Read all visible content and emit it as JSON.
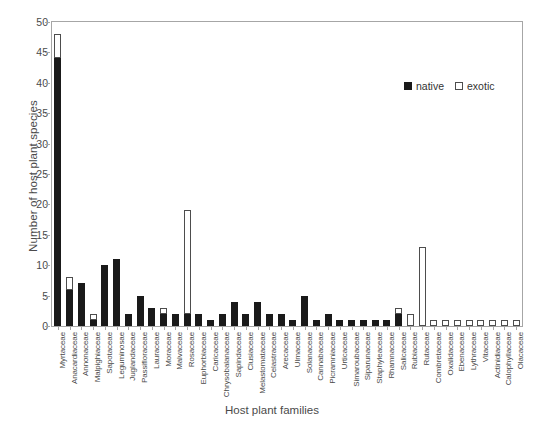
{
  "chart_data": {
    "type": "bar",
    "subtype": "stacked-bar",
    "title": "",
    "xlabel": "Host plant families",
    "ylabel": "Number of host plant species",
    "ylim": [
      0,
      50
    ],
    "yticks": [
      0,
      5,
      10,
      15,
      20,
      25,
      30,
      35,
      40,
      45,
      50
    ],
    "grid": false,
    "legend_position": "top-right",
    "colors": {
      "native": "#1a1a1a",
      "exotic": "#ffffff",
      "exotic_border": "#4d4d4d",
      "axis": "#a6a6a6",
      "text": "#4a4a4a"
    },
    "categories": [
      "Myrtaceae",
      "Anacardiaceae",
      "Annonaceae",
      "Malpighiaceae",
      "Sapotaceae",
      "Leguminosae",
      "Juglandaceae",
      "Passifloraceae",
      "Lauraceae",
      "Moraceae",
      "Malvaceae",
      "Rosaceae",
      "Euphorbiaceae",
      "Caricaceae",
      "Chrysobalanaceae",
      "Sapindaceae",
      "Clusiaceae",
      "Melastomataceae",
      "Celastraceae",
      "Arecaceae",
      "Ulmaceae",
      "Solanaceae",
      "Cannabaceae",
      "Picramniaceae",
      "Urticaceae",
      "Simaroubaceae",
      "Siparunaceae",
      "Staphyleaceae",
      "Rhamnaceae",
      "Salicaceae",
      "Rubiaceae",
      "Rutaceae",
      "Combretaceae",
      "Oxalidaceae",
      "Ebenaceae",
      "Lythraceae",
      "Vitaceae",
      "Actinidiaceae",
      "Calophyllaceae",
      "Olacaceae"
    ],
    "series": [
      {
        "name": "native",
        "values": [
          44,
          6,
          7,
          1,
          10,
          11,
          2,
          5,
          3,
          2,
          2,
          2,
          2,
          1,
          2,
          4,
          2,
          4,
          2,
          2,
          1,
          5,
          1,
          2,
          1,
          1,
          1,
          1,
          1,
          2,
          0,
          0,
          0,
          0,
          0,
          0,
          0,
          0,
          0,
          0
        ]
      },
      {
        "name": "exotic",
        "values": [
          4,
          2,
          0,
          1,
          0,
          0,
          0,
          0,
          0,
          1,
          0,
          17,
          0,
          0,
          0,
          0,
          0,
          0,
          0,
          0,
          0,
          0,
          0,
          0,
          0,
          0,
          0,
          0,
          0,
          1,
          2,
          13,
          1,
          1,
          1,
          1,
          1,
          1,
          1,
          1
        ]
      }
    ],
    "totals": [
      48,
      8,
      7,
      2,
      10,
      11,
      2,
      5,
      3,
      3,
      2,
      19,
      2,
      1,
      2,
      4,
      2,
      4,
      2,
      2,
      1,
      5,
      1,
      2,
      1,
      1,
      1,
      1,
      1,
      3,
      2,
      13,
      1,
      1,
      1,
      1,
      1,
      1,
      1,
      1
    ]
  },
  "legend": {
    "items": [
      {
        "label": "native",
        "swatch": "filled-square-icon"
      },
      {
        "label": "exotic",
        "swatch": "open-square-icon"
      }
    ]
  }
}
